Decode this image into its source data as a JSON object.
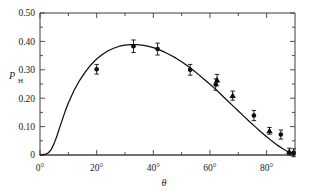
{
  "chart_data": {
    "type": "scatter",
    "title": "",
    "subtitle": "",
    "xlabel": "θ",
    "ylabel": "P",
    "ylabel_sub": "H",
    "xlim": [
      0,
      90
    ],
    "ylim": [
      0,
      0.5
    ],
    "grid": false,
    "legend": "none",
    "x_ticks_major": [
      0,
      20,
      40,
      60,
      80
    ],
    "x_tick_labels": [
      "0°",
      "20°",
      "40°",
      "60°",
      "80°"
    ],
    "x_ticks_minor": [
      10,
      30,
      50,
      70
    ],
    "y_ticks_major": [
      0,
      0.1,
      0.2,
      0.3,
      0.4,
      0.5
    ],
    "y_tick_labels": [
      "0",
      "0.10",
      "0.20",
      "0.30",
      "0.40",
      "0.50"
    ],
    "y_ticks_minor": [
      0.05,
      0.15,
      0.25,
      0.35,
      0.45
    ],
    "series": [
      {
        "name": "measurement-circles",
        "marker": "circle",
        "points": [
          {
            "x": 20.0,
            "y": 0.302,
            "yerr": 0.017
          },
          {
            "x": 33.0,
            "y": 0.383,
            "yerr": 0.022
          },
          {
            "x": 41.5,
            "y": 0.373,
            "yerr": 0.021
          },
          {
            "x": 53.0,
            "y": 0.3,
            "yerr": 0.019
          },
          {
            "x": 62.0,
            "y": 0.248,
            "yerr": 0.02
          },
          {
            "x": 75.5,
            "y": 0.139,
            "yerr": 0.018
          },
          {
            "x": 85.0,
            "y": 0.072,
            "yerr": 0.016
          },
          {
            "x": 89.5,
            "y": 0.008,
            "yerr": 0.014
          }
        ]
      },
      {
        "name": "measurement-triangles",
        "marker": "triangle",
        "points": [
          {
            "x": 62.5,
            "y": 0.264,
            "yerr": 0.02
          },
          {
            "x": 68.0,
            "y": 0.209,
            "yerr": 0.016
          },
          {
            "x": 81.0,
            "y": 0.085,
            "yerr": 0.012
          },
          {
            "x": 88.0,
            "y": 0.012,
            "yerr": 0.012
          }
        ]
      }
    ],
    "model_curve": {
      "name": "fit-curve",
      "x": [
        0,
        1,
        2,
        3,
        4,
        5,
        6,
        7,
        8,
        9,
        10,
        12,
        14,
        16,
        18,
        20,
        22,
        24,
        26,
        28,
        30,
        32,
        34,
        36,
        38,
        40,
        42,
        44,
        46,
        48,
        50,
        52,
        54,
        56,
        58,
        60,
        62,
        64,
        66,
        68,
        70,
        72,
        74,
        76,
        78,
        80,
        82,
        84,
        86,
        88,
        90
      ],
      "y": [
        0.0,
        0.001,
        0.003,
        0.008,
        0.02,
        0.041,
        0.068,
        0.098,
        0.128,
        0.157,
        0.183,
        0.227,
        0.263,
        0.293,
        0.318,
        0.338,
        0.354,
        0.367,
        0.376,
        0.383,
        0.387,
        0.389,
        0.389,
        0.387,
        0.383,
        0.378,
        0.371,
        0.362,
        0.352,
        0.341,
        0.328,
        0.314,
        0.299,
        0.283,
        0.266,
        0.249,
        0.231,
        0.212,
        0.193,
        0.174,
        0.155,
        0.136,
        0.117,
        0.099,
        0.081,
        0.064,
        0.048,
        0.033,
        0.02,
        0.009,
        0.0
      ]
    },
    "baseline": {
      "name": "zero-baseline",
      "value": 0
    }
  }
}
